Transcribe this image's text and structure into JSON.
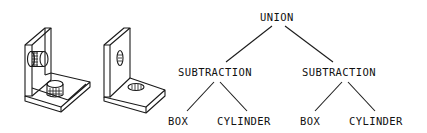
{
  "figure": {
    "illustrations": [
      {
        "id": "wireframe-bracket",
        "description": "L-bracket with two cylinders (wireframe view)"
      },
      {
        "id": "solid-bracket",
        "description": "L-bracket with two holes (solid view)"
      }
    ],
    "tree": {
      "root": {
        "label": "UNION"
      },
      "left": {
        "label": "SUBTRACTION",
        "children": [
          {
            "label": "BOX"
          },
          {
            "label": "CYLINDER"
          }
        ]
      },
      "right": {
        "label": "SUBTRACTION",
        "children": [
          {
            "label": "BOX"
          },
          {
            "label": "CYLINDER"
          }
        ]
      }
    },
    "colors": {
      "line": "#1a1a1a",
      "background": "#ffffff"
    }
  }
}
